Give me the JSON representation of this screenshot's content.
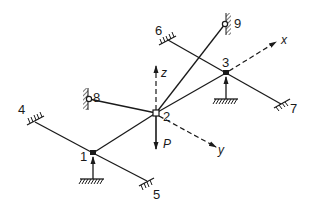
{
  "diagram": {
    "type": "3D frame / grid structure",
    "nodes": [
      {
        "id": "1",
        "label": "1",
        "type": "filled-joint",
        "support": "vertical-roller"
      },
      {
        "id": "2",
        "label": "2",
        "type": "open-joint",
        "load": "P"
      },
      {
        "id": "3",
        "label": "3",
        "type": "filled-joint",
        "support": "vertical-roller"
      },
      {
        "id": "4",
        "label": "4",
        "type": "fixed-support"
      },
      {
        "id": "5",
        "label": "5",
        "type": "fixed-support"
      },
      {
        "id": "6",
        "label": "6",
        "type": "fixed-support"
      },
      {
        "id": "7",
        "label": "7",
        "type": "fixed-support"
      },
      {
        "id": "8",
        "label": "8",
        "type": "pinned-wall"
      },
      {
        "id": "9",
        "label": "9",
        "type": "pinned-wall"
      }
    ],
    "members": [
      [
        "4",
        "1"
      ],
      [
        "1",
        "5"
      ],
      [
        "6",
        "3"
      ],
      [
        "3",
        "7"
      ],
      [
        "1",
        "2"
      ],
      [
        "2",
        "3"
      ],
      [
        "8",
        "2"
      ],
      [
        "2",
        "9"
      ]
    ],
    "axes": {
      "x": "x",
      "y": "y",
      "z": "z"
    },
    "load_label": "P"
  }
}
